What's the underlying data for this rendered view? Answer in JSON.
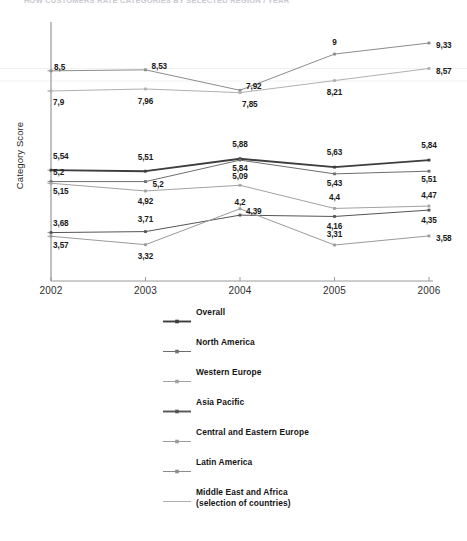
{
  "title_faint": "HOW CUSTOMERS RATE CATEGORIES BY SELECTED REGION / YEAR",
  "axes": {
    "ylabel": "Category Score",
    "xticks": [
      "2002",
      "2003",
      "2004",
      "2005",
      "2006"
    ]
  },
  "legend": {
    "items": [
      {
        "label": "Overall",
        "sub": "",
        "style": "bold-marker"
      },
      {
        "label": "North America",
        "sub": "",
        "style": "light-marker"
      },
      {
        "label": "Western Europe",
        "sub": "",
        "style": "light-line"
      },
      {
        "label": "Asia Pacific",
        "sub": "",
        "style": "bold-marker"
      },
      {
        "label": "Central and Eastern Europe",
        "sub": "",
        "style": "light-marker"
      },
      {
        "label": "Latin America",
        "sub": "",
        "style": "light-cross"
      },
      {
        "label": "Middle East and Africa",
        "sub": "(selection of countries)",
        "style": "plain-line"
      }
    ]
  },
  "chart_data": {
    "type": "line",
    "title": "",
    "xlabel": "",
    "ylabel": "Category Score",
    "x": [
      "2002",
      "2003",
      "2004",
      "2005",
      "2006"
    ],
    "grid": false,
    "legend_position": "bottom",
    "value_label_format": "comma-decimal",
    "series": [
      {
        "name": "Overall",
        "values": [
          5.54,
          5.51,
          5.88,
          5.63,
          5.84
        ],
        "labels": [
          "5,54",
          "5,51",
          "5,88",
          "5,63",
          "5,84"
        ],
        "color": "#3d3d3d",
        "width": 1.9
      },
      {
        "name": "North America",
        "values": [
          5.2,
          5.2,
          5.84,
          5.43,
          5.51
        ],
        "labels": [
          "5,2",
          "5,2",
          "5,84",
          "5,43",
          "5,51"
        ],
        "color": "#6e6e6e",
        "width": 1.0
      },
      {
        "name": "Western Europe",
        "values": [
          5.15,
          4.92,
          5.09,
          4.4,
          4.47
        ],
        "labels": [
          "5,15",
          "4,92",
          "5,09",
          "4,4",
          "4,47"
        ],
        "color": "#a2a2a2",
        "width": 1.0
      },
      {
        "name": "Asia Pacific",
        "values": [
          3.68,
          3.71,
          4.2,
          4.16,
          4.35
        ],
        "labels": [
          "3,68",
          "3,71",
          "4,2",
          "4,16",
          "4,35"
        ],
        "color": "#555555",
        "width": 1.0
      },
      {
        "name": "Central and Eastern Europe",
        "values": [
          3.57,
          3.32,
          4.39,
          3.31,
          3.58
        ],
        "labels": [
          "3,57",
          "3,32",
          "4,39",
          "3,31",
          "3,58"
        ],
        "color": "#9a9a9a",
        "width": 1.0
      },
      {
        "name": "Latin America",
        "values": [
          8.5,
          8.53,
          7.92,
          9.0,
          9.33
        ],
        "labels": [
          "8,5",
          "8,53",
          "7,92",
          "9",
          "9,33"
        ],
        "color": "#8c8c8c",
        "width": 1.0
      },
      {
        "name": "Middle East and Africa",
        "values": [
          7.9,
          7.96,
          7.85,
          8.21,
          8.57
        ],
        "labels": [
          "7,9",
          "7,96",
          "7,85",
          "8,21",
          "8,57"
        ],
        "color": "#b0b0b0",
        "width": 1.0
      }
    ]
  }
}
